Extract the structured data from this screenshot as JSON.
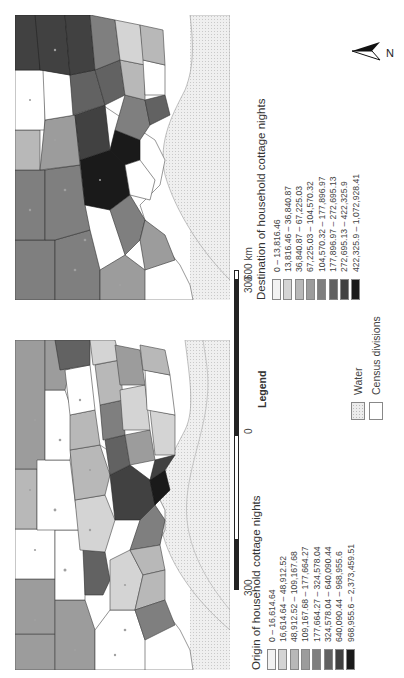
{
  "figure": {
    "orientation": "rotated 90 degrees counter-clockwise",
    "legend_heading": "Legend",
    "scale_bar": {
      "labels": [
        "300",
        "0",
        "300",
        "600 km"
      ],
      "unit": "km"
    },
    "north_arrow": {
      "label": "N"
    },
    "reference_layers": [
      {
        "label": "Water",
        "color": "#ececec",
        "pattern": "dotted"
      },
      {
        "label": "Census divisions",
        "color": "#ffffff",
        "pattern": "outline"
      }
    ],
    "origin_map": {
      "title": "Origin of household cottage nights",
      "classes": [
        {
          "label": "0 – 16,614.64",
          "color": "#f2f2f2"
        },
        {
          "label": "16,614.64 – 48,912.52",
          "color": "#d4d4d4"
        },
        {
          "label": "48,912.52 – 109,167.68",
          "color": "#b8b8b8"
        },
        {
          "label": "109,167.68 – 177,664.27",
          "color": "#9c9c9c"
        },
        {
          "label": "177,664.27 – 324,578.04",
          "color": "#7f7f7f"
        },
        {
          "label": "324,578.04 – 640,090.44",
          "color": "#626262"
        },
        {
          "label": "640,090.44 – 968,955.6",
          "color": "#414141"
        },
        {
          "label": "968,955.6 – 2,373,459.51",
          "color": "#1a1a1a"
        }
      ]
    },
    "destination_map": {
      "title": "Destination of household cottage nights",
      "classes": [
        {
          "label": "0 – 13,816.46",
          "color": "#f2f2f2"
        },
        {
          "label": "13,816.46 – 36,840.87",
          "color": "#d4d4d4"
        },
        {
          "label": "36,840.87 – 67,225.03",
          "color": "#b8b8b8"
        },
        {
          "label": "67,225.03 – 104,570.32",
          "color": "#9c9c9c"
        },
        {
          "label": "104,570.32 – 177,896.97",
          "color": "#7f7f7f"
        },
        {
          "label": "177,896.97 – 272,695.13",
          "color": "#626262"
        },
        {
          "label": "272,695.13 – 422,325.9",
          "color": "#414141"
        },
        {
          "label": "422,325.9 – 1,072,928.41",
          "color": "#1a1a1a"
        }
      ]
    }
  }
}
